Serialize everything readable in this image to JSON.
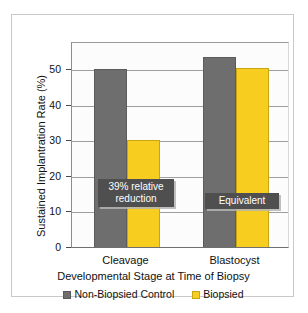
{
  "chart_data": {
    "type": "bar",
    "title": "",
    "xlabel": "Developmental Stage at Time of Biopsy",
    "ylabel": "Sustained Implantration Rate (%)",
    "categories": [
      "Cleavage",
      "Blastocyst"
    ],
    "series": [
      {
        "name": "Non-Biopsied Control",
        "color": "#6e6e6e",
        "values": [
          50,
          53.5
        ]
      },
      {
        "name": "Biopsied",
        "color": "#f7ce20",
        "values": [
          30,
          50.5
        ]
      }
    ],
    "ylim": [
      0,
      58
    ],
    "yticks": [
      0,
      10,
      20,
      30,
      40,
      50
    ],
    "ytick_labels": [
      "0",
      "10",
      "20",
      "30",
      "40",
      "50"
    ],
    "grid": true,
    "legend_position": "bottom",
    "annotations": [
      {
        "text_line1": "39% relative",
        "text_line2": "reduction",
        "group": "Cleavage"
      },
      {
        "text_line1": "Equivalent",
        "text_line2": "",
        "group": "Blastocyst"
      }
    ]
  },
  "legend": {
    "entries": [
      {
        "label": "Non-Biopsied Control"
      },
      {
        "label": "Biopsied"
      }
    ]
  },
  "axis": {
    "y_title": "Sustained Implantration Rate (%)",
    "x_title": "Developmental Stage at Time of Biopsy"
  }
}
